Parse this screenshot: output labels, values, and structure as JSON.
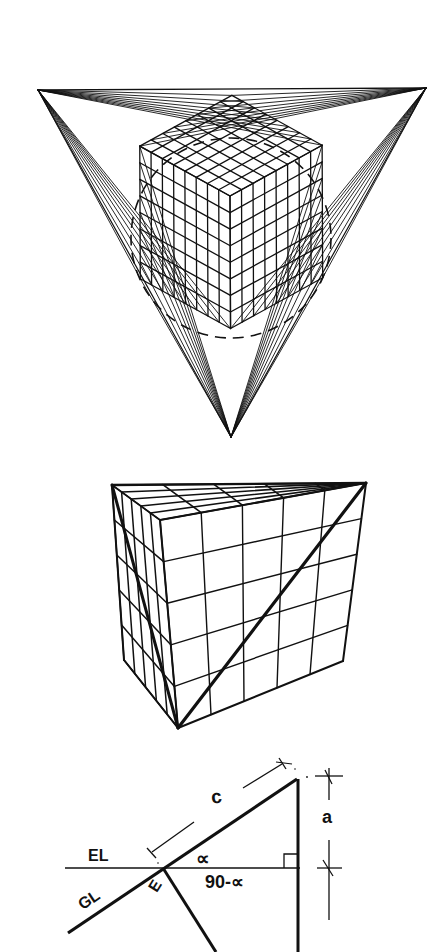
{
  "figures": [
    {
      "id": "three-point-perspective",
      "description": "Three-point perspective construction of a subdivided cube inside an equilateral triangle of vanishing points with dashed cone-of-vision circle",
      "vanishing_points": [
        [
          38,
          90
        ],
        [
          426,
          88
        ],
        [
          231,
          437
        ]
      ],
      "cube_near_corner": [
        230,
        196
      ],
      "subdivisions": 8,
      "cone_of_vision": {
        "cx": 231,
        "cy": 238,
        "r": 100,
        "style": "dashed"
      }
    },
    {
      "id": "subdivided-cube",
      "description": "Perspective cube subdivided 5x5 on the front face with a bold diagonal",
      "subdivisions": 5
    },
    {
      "id": "angle-diagram",
      "labels": {
        "c": "c",
        "a": "a",
        "el": "EL",
        "gl": "GL",
        "e": "E",
        "alpha": "∝",
        "complement": "90-∝"
      }
    }
  ],
  "colors": {
    "ink": "#111111",
    "paper": "#ffffff"
  }
}
